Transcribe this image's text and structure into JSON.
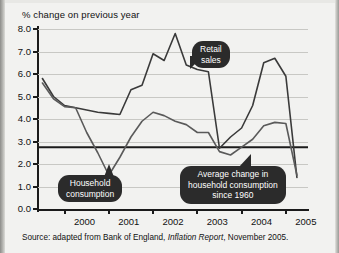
{
  "chart_data": {
    "type": "line",
    "title": "% change on previous year",
    "xlabel": "",
    "ylabel": "% change on previous year",
    "ylim": [
      0.0,
      8.0
    ],
    "ytick_labels": [
      "0.0",
      "1.0",
      "2.0",
      "3.0",
      "4.0",
      "5.0",
      "6.0",
      "7.0",
      "8.0"
    ],
    "ytick_values": [
      0,
      1,
      2,
      3,
      4,
      5,
      6,
      7,
      8
    ],
    "xtick_labels": [
      "2000",
      "2001",
      "2002",
      "2003",
      "2004",
      "2005"
    ],
    "xlim": [
      1999.4,
      2005.5
    ],
    "grid": true,
    "legend_position": "annotations",
    "series": [
      {
        "name": "Retail sales",
        "x": [
          1999.5,
          1999.75,
          2000.0,
          2000.25,
          2000.5,
          2000.75,
          2001.0,
          2001.25,
          2001.5,
          2001.75,
          2002.0,
          2002.25,
          2002.5,
          2002.75,
          2003.0,
          2003.25,
          2003.5,
          2003.75,
          2004.0,
          2004.25,
          2004.5,
          2004.75,
          2005.0,
          2005.25
        ],
        "values": [
          5.8,
          5.0,
          4.6,
          4.5,
          4.4,
          4.3,
          4.25,
          4.2,
          5.3,
          5.5,
          6.9,
          6.6,
          7.8,
          6.4,
          6.2,
          6.1,
          2.7,
          3.2,
          3.6,
          4.6,
          6.5,
          6.7,
          5.9,
          1.4
        ]
      },
      {
        "name": "Household consumption",
        "x": [
          1999.5,
          1999.75,
          2000.0,
          2000.25,
          2000.5,
          2000.75,
          2001.0,
          2001.25,
          2001.5,
          2001.75,
          2002.0,
          2002.25,
          2002.5,
          2002.75,
          2003.0,
          2003.25,
          2003.5,
          2003.75,
          2004.0,
          2004.25,
          2004.5,
          2004.75,
          2005.0,
          2005.25
        ],
        "values": [
          5.6,
          4.9,
          4.55,
          4.5,
          3.4,
          2.5,
          1.5,
          2.3,
          3.2,
          3.9,
          4.3,
          4.15,
          3.9,
          3.75,
          3.4,
          3.4,
          2.55,
          2.4,
          2.75,
          3.1,
          3.7,
          3.85,
          3.8,
          1.5
        ]
      }
    ],
    "reference_line": {
      "name": "Average change in household consumption since 1960",
      "value": 2.75
    },
    "annotations": [
      {
        "name": "retail-sales",
        "text": "Retail\nsales"
      },
      {
        "name": "household-consumption",
        "text": "Household\nconsumption"
      },
      {
        "name": "average-change",
        "text": "Average change in\nhousehold consumption\nsince 1960"
      }
    ],
    "source": {
      "prefix": "Source: adapted from Bank of England, ",
      "italic": "Inflation Report",
      "suffix": ", November 2005."
    },
    "colors": {
      "line": "#333333",
      "reference_line": "#1b1b1b",
      "grid": "#c8c8c4",
      "axis": "#1b1b1b",
      "callout_background": "#2b2b2b",
      "callout_text": "#ffffff",
      "plot_background": "#f2f2f0"
    }
  }
}
